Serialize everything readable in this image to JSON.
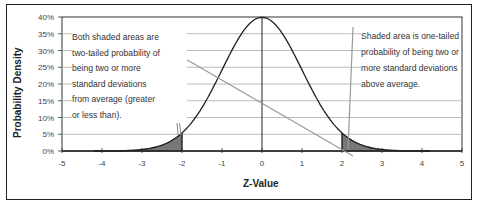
{
  "chart_data": {
    "type": "area",
    "title": "",
    "xlabel": "Z-Value",
    "ylabel": "Probability Density",
    "xlim": [
      -5,
      5
    ],
    "ylim": [
      0,
      40
    ],
    "x_ticks": [
      "-5",
      "-4",
      "-3",
      "-2",
      "-1",
      "0",
      "1",
      "2",
      "3",
      "4",
      "5"
    ],
    "y_ticks": [
      "0%",
      "5%",
      "10%",
      "15%",
      "20%",
      "25%",
      "30%",
      "35%",
      "40%"
    ],
    "grid": "horizontal",
    "series": [
      {
        "name": "Standard normal density",
        "x": [
          -4,
          -3.5,
          -3,
          -2.5,
          -2,
          -1.5,
          -1,
          -0.5,
          0,
          0.5,
          1,
          1.5,
          2,
          2.5,
          3,
          3.5,
          4
        ],
        "values": [
          0.01,
          0.09,
          0.44,
          1.75,
          5.4,
          12.95,
          24.2,
          35.21,
          39.89,
          35.21,
          24.2,
          12.95,
          5.4,
          1.75,
          0.44,
          0.09,
          0.01
        ]
      }
    ],
    "shaded_regions": [
      {
        "from": -5,
        "to": -2,
        "label": "left tail"
      },
      {
        "from": 2,
        "to": 5,
        "label": "right tail"
      }
    ],
    "annotations": [
      {
        "text": "Both shaded areas are two-tailed probability of being two or more standard deviations from average (greater or less than).",
        "position": "upper-left"
      },
      {
        "text": "Shaded area is one-tailed probability of being two or more standard deviations above average.",
        "position": "upper-right"
      }
    ]
  },
  "labels": {
    "ylabel": "Probability Density",
    "xlabel": "Z-Value",
    "ann_left": [
      "Both shaded areas are",
      "two-tailed probability of",
      "being two or more",
      "standard deviations",
      "from average (greater",
      "or less than)."
    ],
    "ann_right": [
      "Shaded area is one-tailed",
      "probability of being two or",
      "more standard deviations",
      "above average."
    ]
  }
}
